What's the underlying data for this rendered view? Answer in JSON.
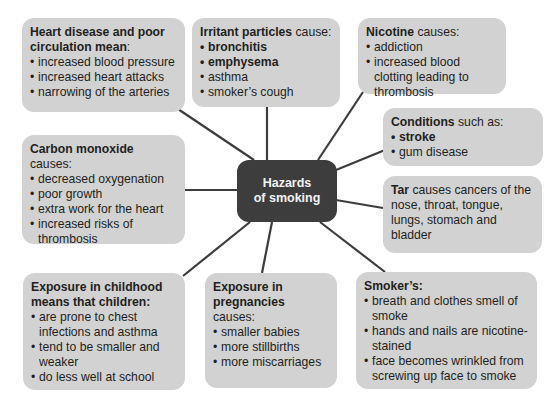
{
  "center": {
    "line1": "Hazards",
    "line2": "of smoking"
  },
  "colors": {
    "box_bg": "#d2d2d2",
    "center_bg": "#3d3d3d",
    "center_text": "#f2f2f2",
    "line": "#3d3d3d"
  },
  "boxes": {
    "heart": {
      "title_bold": "Heart disease and poor circulation mean",
      "title_rest": ":",
      "items": [
        "increased blood pressure",
        "increased heart attacks",
        "narrowing of the arteries"
      ]
    },
    "irritant": {
      "title_bold": "Irritant particles",
      "title_rest": " cause:",
      "items": [
        "bronchitis",
        "emphysema",
        "asthma",
        "smoker’s cough"
      ]
    },
    "nicotine": {
      "title_bold": "Nicotine",
      "title_rest": " causes:",
      "items": [
        "addiction",
        "increased blood clotting leading to thrombosis"
      ]
    },
    "conditions": {
      "title_bold": "Conditions",
      "title_rest": " such as:",
      "items": [
        "stroke",
        "gum disease"
      ]
    },
    "carbon_monoxide": {
      "title_bold": "Carbon monoxide",
      "title_rest": " causes:",
      "items": [
        "decreased oxygenation",
        "poor growth",
        "extra work for the heart",
        "increased risks of thrombosis"
      ]
    },
    "tar": {
      "title_bold": "Tar",
      "title_rest": " causes cancers of the nose, throat, tongue, lungs, stomach and bladder"
    },
    "childhood": {
      "title_bold": "Exposure in childhood means that children:",
      "title_rest": "",
      "items": [
        "are prone to chest infections and asthma",
        "tend to be smaller and weaker",
        "do less well at school"
      ]
    },
    "pregnancy": {
      "title_bold": "Exposure in pregnancies",
      "title_rest": " causes:",
      "items": [
        "smaller babies",
        "more stillbirths",
        "more miscarriages"
      ]
    },
    "smoker": {
      "title_bold": "Smoker’s:",
      "title_rest": "",
      "items": [
        "breath and clothes smell of smoke",
        "hands and nails are nicotine-stained",
        "face becomes wrinkled from screwing up face to smoke"
      ]
    }
  }
}
